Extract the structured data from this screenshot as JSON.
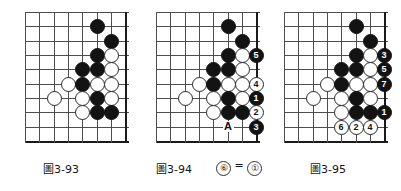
{
  "page": {
    "kind": "go-problem-diagrams",
    "background": "#ffffff",
    "line_color": "#4d4d4d",
    "edge_color": "#1a1a1a",
    "black_color": "#131313",
    "white_color": "#ffffff"
  },
  "figures": [
    {
      "id": "fig-3-93",
      "caption_prefix": "圖",
      "caption_number": "3-93",
      "caption": "圖 3-93",
      "grid": {
        "cols": 8,
        "rows": 10,
        "spacing": 14.3
      },
      "stones": [
        {
          "col": 5,
          "row": 1,
          "color": "black",
          "label": ""
        },
        {
          "col": 6,
          "row": 2,
          "color": "black",
          "label": ""
        },
        {
          "col": 5,
          "row": 3,
          "color": "black",
          "label": ""
        },
        {
          "col": 6,
          "row": 3,
          "color": "white",
          "label": ""
        },
        {
          "col": 4,
          "row": 4,
          "color": "black",
          "label": ""
        },
        {
          "col": 5,
          "row": 4,
          "color": "black",
          "label": ""
        },
        {
          "col": 6,
          "row": 4,
          "color": "white",
          "label": ""
        },
        {
          "col": 3,
          "row": 5,
          "color": "white",
          "label": ""
        },
        {
          "col": 4,
          "row": 5,
          "color": "black",
          "label": ""
        },
        {
          "col": 5,
          "row": 5,
          "color": "white",
          "label": ""
        },
        {
          "col": 6,
          "row": 5,
          "color": "white",
          "label": ""
        },
        {
          "col": 2,
          "row": 6,
          "color": "white",
          "label": ""
        },
        {
          "col": 4,
          "row": 6,
          "color": "white",
          "label": ""
        },
        {
          "col": 5,
          "row": 6,
          "color": "black",
          "label": ""
        },
        {
          "col": 6,
          "row": 6,
          "color": "white",
          "label": ""
        },
        {
          "col": 4,
          "row": 7,
          "color": "white",
          "label": ""
        },
        {
          "col": 5,
          "row": 7,
          "color": "black",
          "label": ""
        },
        {
          "col": 6,
          "row": 7,
          "color": "black",
          "label": ""
        }
      ],
      "letters": []
    },
    {
      "id": "fig-3-94",
      "caption_prefix": "圖",
      "caption_number": "3-94",
      "caption": "圖 3-94",
      "note_html": "⑥ = ①",
      "note_left": "⑥",
      "note_eq": "=",
      "note_right": "①",
      "grid": {
        "cols": 8,
        "rows": 10,
        "spacing": 14.3
      },
      "stones": [
        {
          "col": 5,
          "row": 1,
          "color": "black",
          "label": ""
        },
        {
          "col": 6,
          "row": 2,
          "color": "black",
          "label": ""
        },
        {
          "col": 5,
          "row": 3,
          "color": "black",
          "label": ""
        },
        {
          "col": 6,
          "row": 3,
          "color": "white",
          "label": ""
        },
        {
          "col": 7,
          "row": 3,
          "color": "black",
          "label": "5"
        },
        {
          "col": 4,
          "row": 4,
          "color": "black",
          "label": ""
        },
        {
          "col": 5,
          "row": 4,
          "color": "black",
          "label": ""
        },
        {
          "col": 6,
          "row": 4,
          "color": "white",
          "label": ""
        },
        {
          "col": 3,
          "row": 5,
          "color": "white",
          "label": ""
        },
        {
          "col": 4,
          "row": 5,
          "color": "black",
          "label": ""
        },
        {
          "col": 5,
          "row": 5,
          "color": "white",
          "label": ""
        },
        {
          "col": 6,
          "row": 5,
          "color": "white",
          "label": ""
        },
        {
          "col": 7,
          "row": 5,
          "color": "white",
          "label": "4"
        },
        {
          "col": 2,
          "row": 6,
          "color": "white",
          "label": ""
        },
        {
          "col": 4,
          "row": 6,
          "color": "white",
          "label": ""
        },
        {
          "col": 5,
          "row": 6,
          "color": "black",
          "label": ""
        },
        {
          "col": 6,
          "row": 6,
          "color": "white",
          "label": ""
        },
        {
          "col": 7,
          "row": 6,
          "color": "black",
          "label": "1"
        },
        {
          "col": 4,
          "row": 7,
          "color": "white",
          "label": ""
        },
        {
          "col": 5,
          "row": 7,
          "color": "black",
          "label": ""
        },
        {
          "col": 6,
          "row": 7,
          "color": "black",
          "label": ""
        },
        {
          "col": 7,
          "row": 7,
          "color": "white",
          "label": "2"
        },
        {
          "col": 7,
          "row": 8,
          "color": "black",
          "label": "3"
        }
      ],
      "letters": [
        {
          "col": 5,
          "row": 8,
          "text": "A"
        }
      ]
    },
    {
      "id": "fig-3-95",
      "caption_prefix": "圖",
      "caption_number": "3-95",
      "caption": "圖 3-95",
      "grid": {
        "cols": 8,
        "rows": 10,
        "spacing": 14.3
      },
      "stones": [
        {
          "col": 5,
          "row": 1,
          "color": "black",
          "label": ""
        },
        {
          "col": 6,
          "row": 2,
          "color": "black",
          "label": ""
        },
        {
          "col": 5,
          "row": 3,
          "color": "black",
          "label": ""
        },
        {
          "col": 6,
          "row": 3,
          "color": "white",
          "label": ""
        },
        {
          "col": 7,
          "row": 3,
          "color": "black",
          "label": "3"
        },
        {
          "col": 4,
          "row": 4,
          "color": "black",
          "label": ""
        },
        {
          "col": 5,
          "row": 4,
          "color": "black",
          "label": ""
        },
        {
          "col": 6,
          "row": 4,
          "color": "white",
          "label": ""
        },
        {
          "col": 7,
          "row": 4,
          "color": "black",
          "label": "5"
        },
        {
          "col": 3,
          "row": 5,
          "color": "white",
          "label": ""
        },
        {
          "col": 4,
          "row": 5,
          "color": "black",
          "label": ""
        },
        {
          "col": 5,
          "row": 5,
          "color": "white",
          "label": ""
        },
        {
          "col": 6,
          "row": 5,
          "color": "white",
          "label": ""
        },
        {
          "col": 7,
          "row": 5,
          "color": "black",
          "label": "7"
        },
        {
          "col": 2,
          "row": 6,
          "color": "white",
          "label": ""
        },
        {
          "col": 4,
          "row": 6,
          "color": "white",
          "label": ""
        },
        {
          "col": 5,
          "row": 6,
          "color": "black",
          "label": ""
        },
        {
          "col": 6,
          "row": 6,
          "color": "white",
          "label": ""
        },
        {
          "col": 4,
          "row": 7,
          "color": "white",
          "label": ""
        },
        {
          "col": 5,
          "row": 7,
          "color": "black",
          "label": ""
        },
        {
          "col": 6,
          "row": 7,
          "color": "black",
          "label": ""
        },
        {
          "col": 7,
          "row": 7,
          "color": "black",
          "label": "1"
        },
        {
          "col": 4,
          "row": 8,
          "color": "white",
          "label": "6"
        },
        {
          "col": 5,
          "row": 8,
          "color": "white",
          "label": "2"
        },
        {
          "col": 6,
          "row": 8,
          "color": "white",
          "label": "4"
        }
      ],
      "letters": []
    }
  ]
}
